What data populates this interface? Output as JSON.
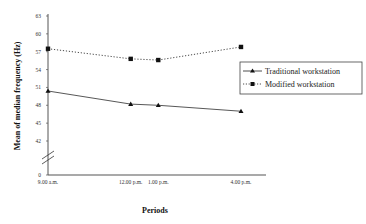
{
  "chart_data": {
    "type": "line",
    "title": "",
    "xlabel": "Periods",
    "ylabel": "Mean of median frequency (Hz)",
    "categories": [
      "9.00 a.m.",
      "12.00 p.m.",
      "1.00 p.m.",
      "4.00 p.m."
    ],
    "x_positions_hours": [
      9,
      12,
      13,
      16
    ],
    "y_ticks": [
      0,
      42,
      45,
      48,
      51,
      54,
      57,
      60,
      63
    ],
    "y_axis_break": true,
    "ylim": [
      42,
      63
    ],
    "grid": false,
    "legend_position": "right",
    "series": [
      {
        "name": "Traditional workstation",
        "marker": "triangle",
        "line_style": "solid",
        "color": "#000000",
        "values": [
          50.4,
          48.2,
          48.0,
          47.0
        ]
      },
      {
        "name": "Modified workstation",
        "marker": "square",
        "line_style": "dotted",
        "color": "#000000",
        "values": [
          57.5,
          55.8,
          55.6,
          57.8
        ]
      }
    ]
  }
}
